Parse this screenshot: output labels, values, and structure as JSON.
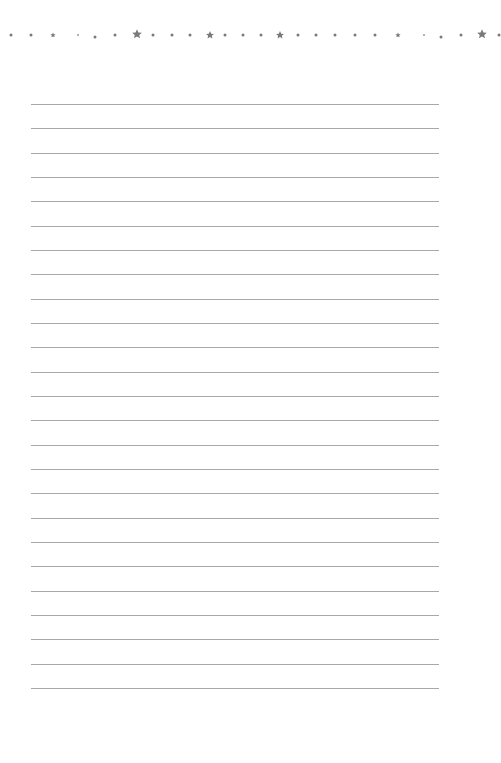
{
  "page": {
    "type": "lined-paper",
    "background": "#ffffff",
    "line_color": "#a8a8a8",
    "decor_color": "#7a7a7a",
    "lines": {
      "count": 25,
      "first_y": 104,
      "spacing": 24.33,
      "x_start": 31,
      "x_end": 439
    },
    "border_decor": [
      {
        "kind": "dot",
        "x": 11,
        "y": 35
      },
      {
        "kind": "dot",
        "x": 31,
        "y": 35
      },
      {
        "kind": "star",
        "size": 6,
        "x": 53,
        "y": 35
      },
      {
        "kind": "tiny",
        "x": 78,
        "y": 35
      },
      {
        "kind": "dot",
        "x": 95,
        "y": 37
      },
      {
        "kind": "dot",
        "x": 115,
        "y": 35
      },
      {
        "kind": "star",
        "size": 11,
        "x": 137,
        "y": 34
      },
      {
        "kind": "dot",
        "x": 153,
        "y": 35
      },
      {
        "kind": "dot",
        "x": 172,
        "y": 35
      },
      {
        "kind": "dot",
        "x": 190,
        "y": 35
      },
      {
        "kind": "star",
        "size": 9,
        "x": 210,
        "y": 35
      },
      {
        "kind": "dot",
        "x": 225,
        "y": 35
      },
      {
        "kind": "dot",
        "x": 243,
        "y": 35
      },
      {
        "kind": "dot",
        "x": 261,
        "y": 35
      },
      {
        "kind": "star",
        "size": 9,
        "x": 280,
        "y": 35
      },
      {
        "kind": "dot",
        "x": 298,
        "y": 35
      },
      {
        "kind": "dot",
        "x": 316,
        "y": 35
      },
      {
        "kind": "dot",
        "x": 335,
        "y": 35
      },
      {
        "kind": "dot",
        "x": 355,
        "y": 35
      },
      {
        "kind": "dot",
        "x": 375,
        "y": 35
      },
      {
        "kind": "star",
        "size": 6,
        "x": 398,
        "y": 35
      },
      {
        "kind": "tiny",
        "x": 424,
        "y": 35
      },
      {
        "kind": "dot",
        "x": 441,
        "y": 37
      },
      {
        "kind": "dot",
        "x": 461,
        "y": 35
      },
      {
        "kind": "star",
        "size": 11,
        "x": 482,
        "y": 34
      },
      {
        "kind": "dot",
        "x": 499,
        "y": 35
      }
    ]
  }
}
